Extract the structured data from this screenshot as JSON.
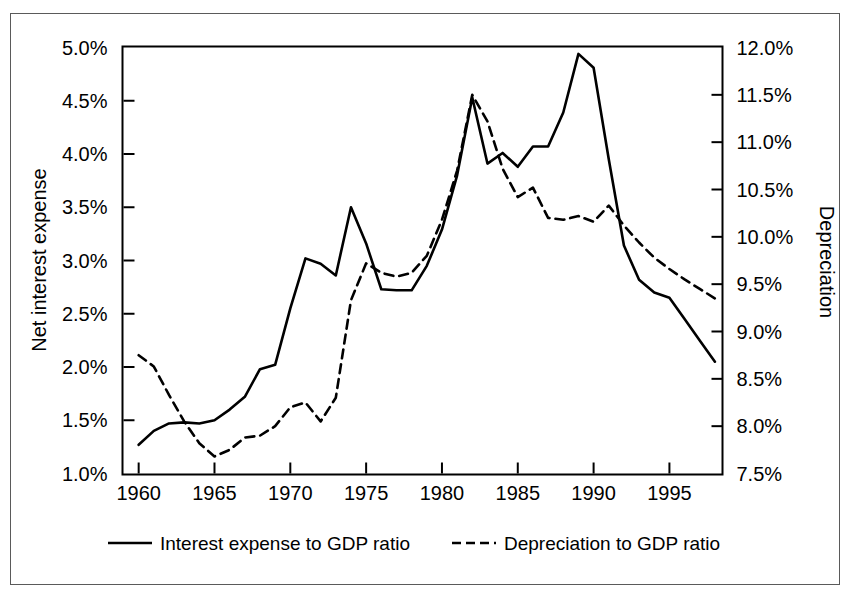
{
  "chart_data": {
    "type": "line",
    "title": "",
    "xlabel": "",
    "ylabel": "Net interest expense",
    "y2label": "Depreciation",
    "xlim": [
      1959,
      1998.5
    ],
    "ylim": [
      1.0,
      5.0
    ],
    "y2lim": [
      7.5,
      12.0
    ],
    "grid": false,
    "legend_position": "bottom",
    "x_ticks": [
      "1960",
      "1965",
      "1970",
      "1975",
      "1980",
      "1985",
      "1990",
      "1995"
    ],
    "x_tick_values": [
      1960,
      1965,
      1970,
      1975,
      1980,
      1985,
      1990,
      1995
    ],
    "y_ticks": [
      "1.0%",
      "1.5%",
      "2.0%",
      "2.5%",
      "3.0%",
      "3.5%",
      "4.0%",
      "4.5%",
      "5.0%"
    ],
    "y_tick_values": [
      1.0,
      1.5,
      2.0,
      2.5,
      3.0,
      3.5,
      4.0,
      4.5,
      5.0
    ],
    "y2_ticks": [
      "7.5%",
      "8.0%",
      "8.5%",
      "9.0%",
      "9.5%",
      "10.0%",
      "10.5%",
      "11.0%",
      "11.5%",
      "12.0%"
    ],
    "y2_tick_values": [
      7.5,
      8.0,
      8.5,
      9.0,
      9.5,
      10.0,
      10.5,
      11.0,
      11.5,
      12.0
    ],
    "x": [
      1960,
      1961,
      1962,
      1963,
      1964,
      1965,
      1966,
      1967,
      1968,
      1969,
      1970,
      1971,
      1972,
      1973,
      1974,
      1975,
      1976,
      1977,
      1978,
      1979,
      1980,
      1981,
      1982,
      1983,
      1984,
      1985,
      1986,
      1987,
      1988,
      1989,
      1990,
      1991,
      1992,
      1993,
      1994,
      1995,
      1996,
      1997,
      1998
    ],
    "series": [
      {
        "name": "Interest expense to GDP ratio",
        "axis": "left",
        "style": "solid",
        "color": "#000000",
        "values": [
          1.27,
          1.4,
          1.47,
          1.48,
          1.47,
          1.5,
          1.6,
          1.72,
          1.98,
          2.02,
          2.55,
          3.02,
          2.97,
          2.86,
          3.5,
          3.16,
          2.73,
          2.72,
          2.72,
          2.95,
          3.29,
          3.8,
          4.53,
          3.91,
          4.01,
          3.88,
          4.07,
          4.07,
          4.39,
          4.94,
          4.81,
          3.95,
          3.14,
          2.82,
          2.7,
          2.65,
          2.45,
          2.25,
          2.05
        ]
      },
      {
        "name": "Depreciation to GDP ratio",
        "axis": "right",
        "style": "dashed",
        "color": "#000000",
        "values": [
          8.75,
          8.63,
          8.33,
          8.05,
          7.82,
          7.68,
          7.75,
          7.88,
          7.9,
          8.0,
          8.2,
          8.25,
          8.05,
          8.3,
          9.33,
          9.72,
          9.62,
          9.58,
          9.62,
          9.8,
          10.18,
          10.7,
          11.5,
          11.22,
          10.72,
          10.42,
          10.52,
          10.2,
          10.18,
          10.22,
          10.16,
          10.33,
          10.12,
          9.94,
          9.78,
          9.66,
          9.55,
          9.45,
          9.35
        ]
      }
    ],
    "legend": [
      {
        "label": "Interest expense to GDP ratio",
        "style": "solid"
      },
      {
        "label": "Depreciation to GDP ratio",
        "style": "dashed"
      }
    ]
  }
}
